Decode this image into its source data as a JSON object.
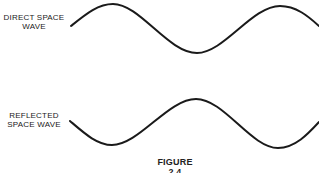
{
  "figure": {
    "caption": "FIGURE 2.4",
    "stroke_color": "#1a1a1a",
    "background": "#ffffff"
  },
  "waves": [
    {
      "id": "direct",
      "label_lines": [
        "DIRECT SPACE",
        "WAVE"
      ],
      "phase": "starts rising to crest",
      "path": "M71,26 C86,14 98,4 113,4 C140,4 168,53 197,53 C224,53 252,6 280,6 C296,6 308,16 319,26"
    },
    {
      "id": "reflected",
      "label_lines": [
        "REFLECTED",
        "SPACE WAVE"
      ],
      "phase": "starts falling to trough (180° out of phase)",
      "path": "M70,121 C84,133 97,145 112,145 C139,145 168,99 196,99 C224,99 251,148 278,148 C295,148 308,134 319,122"
    }
  ]
}
